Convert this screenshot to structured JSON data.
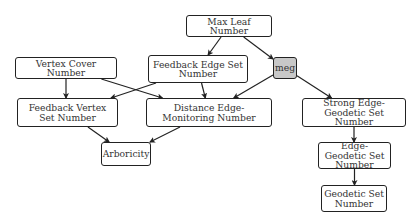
{
  "diagram": {
    "type": "hierarchy",
    "nodes": [
      {
        "id": "mln",
        "label": "Max Leaf Number",
        "x": 186,
        "y": 15,
        "w": 86,
        "h": 22
      },
      {
        "id": "vc",
        "label": "Vertex Cover Number",
        "x": 15,
        "y": 57,
        "w": 102,
        "h": 22
      },
      {
        "id": "fes",
        "label": "Feedback Edge Set Number",
        "x": 148,
        "y": 55,
        "w": 100,
        "h": 28
      },
      {
        "id": "meg",
        "label": "meg",
        "x": 273,
        "y": 57,
        "w": 24,
        "h": 22,
        "highlight": true
      },
      {
        "id": "fvs",
        "label": "Feedback Vertex Set Number",
        "x": 17,
        "y": 98,
        "w": 101,
        "h": 29
      },
      {
        "id": "dem",
        "label": "Distance Edge-Monitoring Number",
        "x": 146,
        "y": 98,
        "w": 126,
        "h": 29
      },
      {
        "id": "seg",
        "label": "Strong Edge-Geodetic Set Number",
        "x": 302,
        "y": 98,
        "w": 104,
        "h": 29
      },
      {
        "id": "arb",
        "label": "Arboricity",
        "x": 101,
        "y": 142,
        "w": 50,
        "h": 24
      },
      {
        "id": "eg",
        "label": "Edge-Geodetic Set Number",
        "x": 318,
        "y": 142,
        "w": 73,
        "h": 27
      },
      {
        "id": "gs",
        "label": "Geodetic Set Number",
        "x": 321,
        "y": 185,
        "w": 66,
        "h": 27
      }
    ],
    "edges": [
      {
        "from": "mln",
        "to": "fes"
      },
      {
        "from": "mln",
        "to": "meg"
      },
      {
        "from": "vc",
        "to": "fvs"
      },
      {
        "from": "vc",
        "to": "dem"
      },
      {
        "from": "fes",
        "to": "fvs"
      },
      {
        "from": "fes",
        "to": "dem"
      },
      {
        "from": "meg",
        "to": "dem"
      },
      {
        "from": "meg",
        "to": "seg"
      },
      {
        "from": "fvs",
        "to": "arb"
      },
      {
        "from": "dem",
        "to": "arb"
      },
      {
        "from": "seg",
        "to": "eg"
      },
      {
        "from": "eg",
        "to": "gs"
      }
    ],
    "colors": {
      "highlight_fill": "#c8c8c8",
      "stroke": "#222222",
      "text": "#333333"
    }
  }
}
